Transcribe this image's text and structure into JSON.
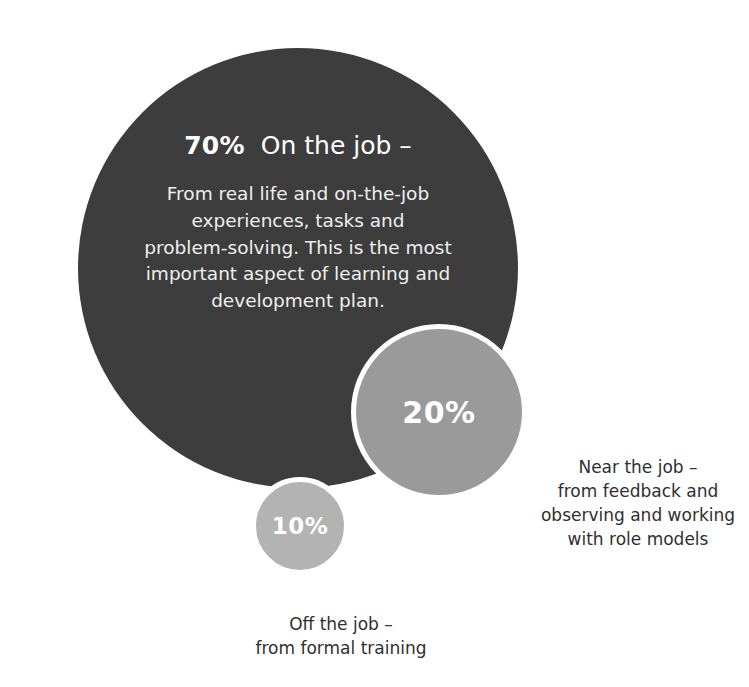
{
  "chart_data": {
    "type": "pie",
    "title": "",
    "subtitle": "",
    "xlabel": "",
    "ylabel": "",
    "legend_position": "outside-labels",
    "grid": false,
    "categories": [
      "On the job",
      "Near the job",
      "Off the job"
    ],
    "values": [
      70,
      20,
      10
    ],
    "value_labels": [
      "70%",
      "20%",
      "10%"
    ],
    "units": "percent",
    "series": [
      {
        "name": "70-20-10 learning model",
        "values": [
          70,
          20,
          10
        ]
      }
    ],
    "annotations": [
      "70% On the job – From real life and on-the-job experiences, tasks and problem-solving. This is the most important aspect of learning and development plan.",
      "20% Near the job – from feedback and observing and working with role models",
      "10% Off the job – from formal training"
    ]
  },
  "colors": {
    "background": "#ffffff",
    "bubble_70": "#3d3d3d",
    "bubble_20": "#9a9a9a",
    "bubble_10": "#b3b3b3",
    "bubble_ring": "#ffffff",
    "text_on_dark": "#ffffff",
    "body_on_dark": "#efefef",
    "caption_text": "#2f2f2f"
  },
  "bubble_70": {
    "percent": "70%",
    "headline": "On the job –",
    "body_lines": [
      "From real life and on-the-job",
      "experiences, tasks and",
      "problem-solving. This is the most",
      "important aspect of learning and",
      "development plan."
    ],
    "body": "From real life and on-the-job experiences, tasks and problem-solving. This is the most important aspect of learning and development plan."
  },
  "bubble_20": {
    "percent": "20%",
    "caption_lines": [
      "Near the job –",
      "from feedback and",
      "observing and working",
      "with role models"
    ],
    "caption": "Near the job – from feedback and observing and working with role models"
  },
  "bubble_10": {
    "percent": "10%",
    "caption_lines": [
      "Off the job –",
      "from formal training"
    ],
    "caption": "Off the job – from formal training"
  }
}
